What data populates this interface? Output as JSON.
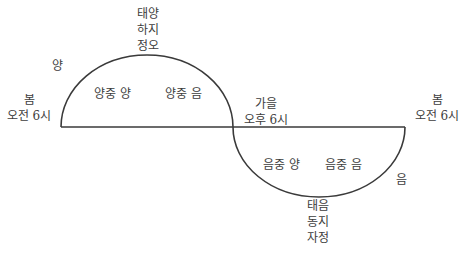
{
  "diagram": {
    "type": "yin-yang-cycle",
    "line_color": "#3a3a3a",
    "top_apex": [
      "태양",
      "하지",
      "정오"
    ],
    "bottom_apex": [
      "태음",
      "동지",
      "자정"
    ],
    "left_start": [
      "봄",
      "오전 6시"
    ],
    "right_end": [
      "봄",
      "오전 6시"
    ],
    "middle_cross": [
      "가을",
      "오후 6시"
    ],
    "yang_label": "양",
    "yin_label": "음",
    "upper_inner": [
      "양중 양",
      "양중 음"
    ],
    "lower_inner": [
      "음중 양",
      "음중 음"
    ]
  }
}
